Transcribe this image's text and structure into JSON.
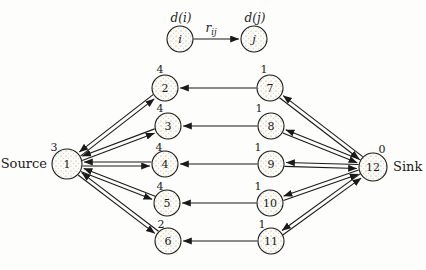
{
  "figure": {
    "colors": {
      "ink": "#1a1a1a",
      "paper": "#fdfdfb",
      "node_base": "#fcfbf6",
      "dot_dark": "#aaa49a",
      "dot_light": "#c9c4ba"
    },
    "legend": {
      "node_i": {
        "label": "i",
        "x": 180,
        "y": 39,
        "r": 13
      },
      "node_j": {
        "label": "j",
        "x": 254,
        "y": 39,
        "r": 13
      },
      "d_i": {
        "text": "d(i)",
        "x": 181,
        "y": 18
      },
      "d_j": {
        "text": "d(j)",
        "x": 255,
        "y": 18
      },
      "r": {
        "main": "r",
        "sub": "ij",
        "x": 211,
        "y": 29
      }
    },
    "source_label": "Source",
    "sink_label": "Sink",
    "nodes": [
      {
        "id": "1",
        "label": "1",
        "x": 67,
        "y": 164,
        "r": 15,
        "d": "3",
        "ddx": -13,
        "ddy": -17,
        "side": "Source",
        "side_pos": "left"
      },
      {
        "id": "2",
        "label": "2",
        "x": 165,
        "y": 88,
        "r": 13,
        "d": "4",
        "ddx": -5,
        "ddy": -19
      },
      {
        "id": "3",
        "label": "3",
        "x": 168,
        "y": 126,
        "r": 13,
        "d": "4",
        "ddx": -8,
        "ddy": -18
      },
      {
        "id": "4",
        "label": "4",
        "x": 165,
        "y": 164,
        "r": 13,
        "d": "4",
        "ddx": -6,
        "ddy": -17
      },
      {
        "id": "5",
        "label": "5",
        "x": 167,
        "y": 203,
        "r": 13,
        "d": "4",
        "ddx": -7,
        "ddy": -17
      },
      {
        "id": "6",
        "label": "6",
        "x": 168,
        "y": 241,
        "r": 13,
        "d": "2",
        "ddx": -7,
        "ddy": -17
      },
      {
        "id": "7",
        "label": "7",
        "x": 270,
        "y": 88,
        "r": 13,
        "d": "1",
        "ddx": -6,
        "ddy": -19
      },
      {
        "id": "8",
        "label": "8",
        "x": 271,
        "y": 126,
        "r": 13,
        "d": "1",
        "ddx": -12,
        "ddy": -18
      },
      {
        "id": "9",
        "label": "9",
        "x": 271,
        "y": 164,
        "r": 13,
        "d": "1",
        "ddx": -13,
        "ddy": -17
      },
      {
        "id": "10",
        "label": "10",
        "x": 270,
        "y": 203,
        "r": 13,
        "d": "1",
        "ddx": -12,
        "ddy": -17
      },
      {
        "id": "11",
        "label": "11",
        "x": 271,
        "y": 241,
        "r": 13,
        "d": "1",
        "ddx": -9,
        "ddy": -17
      },
      {
        "id": "12",
        "label": "12",
        "x": 373,
        "y": 167,
        "r": 14,
        "d": "0",
        "ddx": 9,
        "ddy": -18,
        "side": "Sink",
        "side_pos": "right"
      }
    ],
    "edges": [
      {
        "a": "1",
        "b": "2",
        "kind": "pair"
      },
      {
        "a": "1",
        "b": "3",
        "kind": "pair"
      },
      {
        "a": "1",
        "b": "4",
        "kind": "pair"
      },
      {
        "a": "1",
        "b": "5",
        "kind": "pair"
      },
      {
        "a": "1",
        "b": "6",
        "kind": "pair"
      },
      {
        "a": "7",
        "b": "2",
        "kind": "single"
      },
      {
        "a": "8",
        "b": "3",
        "kind": "single"
      },
      {
        "a": "9",
        "b": "4",
        "kind": "single"
      },
      {
        "a": "10",
        "b": "5",
        "kind": "single"
      },
      {
        "a": "11",
        "b": "6",
        "kind": "single"
      },
      {
        "a": "12",
        "b": "7",
        "kind": "pair"
      },
      {
        "a": "12",
        "b": "8",
        "kind": "pair"
      },
      {
        "a": "12",
        "b": "9",
        "kind": "pair"
      },
      {
        "a": "12",
        "b": "10",
        "kind": "pair"
      },
      {
        "a": "12",
        "b": "11",
        "kind": "pair"
      }
    ]
  }
}
